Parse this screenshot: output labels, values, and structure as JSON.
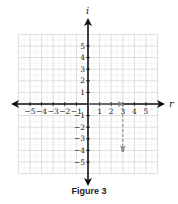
{
  "figure": {
    "caption": "Figure 3",
    "x_axis_label": "r",
    "y_axis_label": "i",
    "x_ticks": [
      "-5",
      "-4",
      "-3",
      "-2",
      "-1",
      "1",
      "2",
      "3",
      "4",
      "5"
    ],
    "y_ticks": [
      "5",
      "4",
      "3",
      "2",
      "1",
      "-1",
      "-2",
      "-3",
      "-4",
      "-5"
    ]
  },
  "colors": {
    "axis": "#111111",
    "grid": "#c8c8c8",
    "vector": "#8a8a8a"
  },
  "vectors": [
    {
      "name": "real-part",
      "from": [
        0,
        0
      ],
      "to": [
        3,
        0
      ],
      "style": "solid"
    },
    {
      "name": "imaginary-part",
      "from": [
        3,
        0
      ],
      "to": [
        3,
        -4
      ],
      "style": "dashed"
    }
  ],
  "point": {
    "x": 3,
    "y": -4,
    "label": "3 - 4i"
  }
}
